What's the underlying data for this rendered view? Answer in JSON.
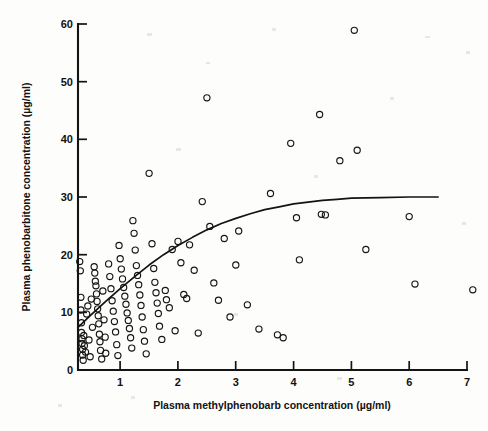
{
  "figure": {
    "background_color": "#fdfdfc",
    "ink_color": "#141414"
  },
  "chart_data": {
    "type": "scatter",
    "title": "",
    "subtitle": "",
    "xlabel": "Plasma methylphenobarb concentration (µg/ml)",
    "ylabel": "Plasma phenobarbitone concentration (µg/ml)",
    "xlim": [
      0.27,
      7.0
    ],
    "ylim": [
      0,
      60
    ],
    "xticks": [
      1,
      2,
      3,
      4,
      5,
      6,
      7
    ],
    "xtick_labels": [
      "1",
      "2",
      "3",
      "4",
      "5",
      "6",
      "7"
    ],
    "yticks": [
      0,
      10,
      20,
      30,
      40,
      50,
      60
    ],
    "ytick_labels": [
      "0",
      "10",
      "20",
      "30",
      "40",
      "50",
      "60"
    ],
    "grid": false,
    "legend": null,
    "marker": "open-circle",
    "annotations": [],
    "series": [
      {
        "name": "patients",
        "marker": "open-circle",
        "points": [
          [
            0.3,
            18.8
          ],
          [
            0.31,
            17.2
          ],
          [
            0.32,
            12.6
          ],
          [
            0.32,
            10.4
          ],
          [
            0.33,
            8.2
          ],
          [
            0.33,
            6.5
          ],
          [
            0.34,
            5.4
          ],
          [
            0.34,
            4.6
          ],
          [
            0.35,
            3.6
          ],
          [
            0.35,
            2.6
          ],
          [
            0.36,
            1.7
          ],
          [
            0.37,
            6.0
          ],
          [
            0.38,
            4.2
          ],
          [
            0.4,
            3.1
          ],
          [
            0.42,
            9.7
          ],
          [
            0.44,
            11.1
          ],
          [
            0.46,
            5.2
          ],
          [
            0.48,
            2.3
          ],
          [
            0.5,
            12.3
          ],
          [
            0.52,
            7.4
          ],
          [
            0.55,
            17.9
          ],
          [
            0.56,
            16.8
          ],
          [
            0.57,
            15.4
          ],
          [
            0.58,
            14.6
          ],
          [
            0.59,
            13.2
          ],
          [
            0.6,
            11.9
          ],
          [
            0.61,
            10.6
          ],
          [
            0.62,
            9.4
          ],
          [
            0.63,
            8.0
          ],
          [
            0.64,
            6.2
          ],
          [
            0.65,
            4.9
          ],
          [
            0.66,
            3.4
          ],
          [
            0.68,
            1.9
          ],
          [
            0.7,
            13.7
          ],
          [
            0.72,
            8.7
          ],
          [
            0.74,
            5.7
          ],
          [
            0.75,
            2.9
          ],
          [
            0.8,
            18.4
          ],
          [
            0.82,
            16.2
          ],
          [
            0.84,
            14.1
          ],
          [
            0.86,
            12.0
          ],
          [
            0.88,
            10.2
          ],
          [
            0.9,
            8.4
          ],
          [
            0.92,
            6.6
          ],
          [
            0.94,
            4.4
          ],
          [
            0.96,
            2.5
          ],
          [
            0.98,
            21.6
          ],
          [
            1.0,
            19.3
          ],
          [
            1.02,
            17.5
          ],
          [
            1.04,
            15.8
          ],
          [
            1.06,
            14.3
          ],
          [
            1.08,
            12.8
          ],
          [
            1.1,
            11.4
          ],
          [
            1.12,
            9.9
          ],
          [
            1.14,
            8.6
          ],
          [
            1.16,
            7.2
          ],
          [
            1.18,
            5.6
          ],
          [
            1.2,
            3.8
          ],
          [
            1.22,
            25.9
          ],
          [
            1.24,
            23.7
          ],
          [
            1.26,
            20.8
          ],
          [
            1.28,
            18.1
          ],
          [
            1.3,
            16.4
          ],
          [
            1.32,
            14.8
          ],
          [
            1.34,
            13.0
          ],
          [
            1.36,
            11.2
          ],
          [
            1.38,
            9.2
          ],
          [
            1.4,
            7.0
          ],
          [
            1.42,
            5.0
          ],
          [
            1.45,
            2.8
          ],
          [
            1.5,
            34.1
          ],
          [
            1.55,
            21.9
          ],
          [
            1.58,
            17.6
          ],
          [
            1.6,
            15.2
          ],
          [
            1.62,
            13.4
          ],
          [
            1.64,
            11.6
          ],
          [
            1.66,
            9.8
          ],
          [
            1.68,
            7.6
          ],
          [
            1.72,
            5.3
          ],
          [
            1.78,
            13.8
          ],
          [
            1.8,
            12.2
          ],
          [
            1.85,
            10.8
          ],
          [
            1.9,
            20.9
          ],
          [
            1.95,
            6.8
          ],
          [
            2.0,
            22.3
          ],
          [
            2.05,
            18.6
          ],
          [
            2.1,
            13.1
          ],
          [
            2.15,
            12.4
          ],
          [
            2.2,
            21.7
          ],
          [
            2.28,
            17.3
          ],
          [
            2.35,
            6.4
          ],
          [
            2.42,
            29.2
          ],
          [
            2.5,
            47.2
          ],
          [
            2.55,
            24.9
          ],
          [
            2.62,
            15.1
          ],
          [
            2.7,
            12.1
          ],
          [
            2.8,
            22.8
          ],
          [
            2.9,
            9.2
          ],
          [
            3.0,
            18.2
          ],
          [
            3.05,
            24.1
          ],
          [
            3.2,
            11.3
          ],
          [
            3.4,
            7.1
          ],
          [
            3.6,
            30.6
          ],
          [
            3.72,
            6.1
          ],
          [
            3.82,
            5.6
          ],
          [
            3.95,
            39.3
          ],
          [
            4.05,
            26.4
          ],
          [
            4.1,
            19.1
          ],
          [
            4.45,
            44.3
          ],
          [
            4.48,
            27.0
          ],
          [
            4.55,
            26.9
          ],
          [
            4.8,
            36.3
          ],
          [
            5.05,
            58.9
          ],
          [
            5.1,
            38.1
          ],
          [
            5.25,
            20.9
          ],
          [
            6.0,
            26.6
          ],
          [
            6.1,
            14.9
          ],
          [
            7.1,
            13.9
          ]
        ]
      }
    ],
    "fit_curve": {
      "name": "fitted curve",
      "description": "rising saturating curve",
      "points": [
        [
          0.27,
          7.4
        ],
        [
          0.5,
          9.6
        ],
        [
          0.75,
          11.9
        ],
        [
          1.0,
          14.1
        ],
        [
          1.25,
          16.2
        ],
        [
          1.5,
          18.2
        ],
        [
          1.75,
          20.0
        ],
        [
          2.0,
          21.6
        ],
        [
          2.25,
          23.0
        ],
        [
          2.5,
          24.3
        ],
        [
          2.75,
          25.4
        ],
        [
          3.0,
          26.3
        ],
        [
          3.25,
          27.1
        ],
        [
          3.5,
          27.8
        ],
        [
          3.75,
          28.3
        ],
        [
          4.0,
          28.8
        ],
        [
          4.25,
          29.1
        ],
        [
          4.5,
          29.4
        ],
        [
          4.75,
          29.6
        ],
        [
          5.0,
          29.8
        ],
        [
          5.5,
          29.9
        ],
        [
          6.0,
          30.0
        ],
        [
          6.5,
          30.0
        ]
      ]
    }
  }
}
